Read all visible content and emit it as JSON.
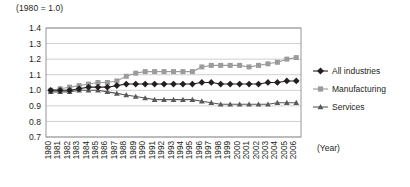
{
  "chart_data": {
    "type": "line",
    "title": "",
    "subtitle": "",
    "unit_note": "(1980 = 1.0)",
    "xlabel": "(Year)",
    "ylabel": "",
    "grid": true,
    "legend_position": "right",
    "ylim": [
      0.7,
      1.4
    ],
    "yticks": [
      "0.7",
      "0.8",
      "0.9",
      "1.0",
      "1.1",
      "1.2",
      "1.3",
      "1.4"
    ],
    "ytick_values": [
      0.7,
      0.8,
      0.9,
      1.0,
      1.1,
      1.2,
      1.3,
      1.4
    ],
    "categories": [
      "1980",
      "1981",
      "1982",
      "1983",
      "1984",
      "1985",
      "1986",
      "1987",
      "1988",
      "1989",
      "1990",
      "1991",
      "1992",
      "1993",
      "1994",
      "1995",
      "1996",
      "1997",
      "1998",
      "1999",
      "2000",
      "2001",
      "2002",
      "2003",
      "2004",
      "2005",
      "2006"
    ],
    "series": [
      {
        "name": "All industries",
        "marker": "diamond",
        "color": "#231f20",
        "values": [
          1.0,
          1.0,
          1.0,
          1.01,
          1.02,
          1.02,
          1.02,
          1.03,
          1.04,
          1.04,
          1.04,
          1.04,
          1.04,
          1.04,
          1.04,
          1.04,
          1.05,
          1.05,
          1.04,
          1.04,
          1.04,
          1.04,
          1.04,
          1.05,
          1.05,
          1.06,
          1.06
        ]
      },
      {
        "name": "Manufacturing",
        "marker": "square",
        "color": "#9b9b9b",
        "values": [
          1.0,
          1.01,
          1.02,
          1.03,
          1.04,
          1.05,
          1.05,
          1.06,
          1.09,
          1.11,
          1.12,
          1.12,
          1.12,
          1.12,
          1.12,
          1.12,
          1.15,
          1.16,
          1.16,
          1.16,
          1.16,
          1.15,
          1.16,
          1.17,
          1.18,
          1.2,
          1.21
        ]
      },
      {
        "name": "Services",
        "marker": "triangle",
        "color": "#58595b",
        "values": [
          0.99,
          0.99,
          0.99,
          1.0,
          1.0,
          1.0,
          0.99,
          0.98,
          0.97,
          0.96,
          0.95,
          0.94,
          0.94,
          0.94,
          0.94,
          0.94,
          0.93,
          0.92,
          0.91,
          0.91,
          0.91,
          0.91,
          0.91,
          0.91,
          0.92,
          0.92,
          0.92
        ]
      }
    ]
  },
  "legend": {
    "items": [
      {
        "label": "All industries"
      },
      {
        "label": "Manufacturing"
      },
      {
        "label": "Services"
      }
    ]
  }
}
